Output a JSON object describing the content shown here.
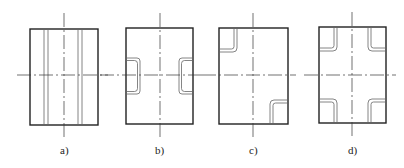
{
  "figures": [
    {
      "id": "a",
      "label": "a)",
      "rect": {
        "x": 30,
        "y": 29,
        "w": 68,
        "h": 96
      },
      "center": {
        "cx": 64,
        "cy": 75,
        "vtop": 13,
        "vbottom": 139,
        "hleft": 17,
        "hright": 108
      },
      "variant": "vertical-grooves",
      "description": "Full-length vertical grooves on both sides of center"
    },
    {
      "id": "b",
      "label": "b)",
      "rect": {
        "x": 126,
        "y": 28,
        "w": 67,
        "h": 96
      },
      "center": {
        "cx": 160,
        "cy": 75,
        "vtop": 13,
        "vbottom": 138,
        "hleft": 100,
        "hright": 203
      },
      "variant": "side-notches",
      "description": "Rounded notches at mid-height on left and right edges"
    },
    {
      "id": "c",
      "label": "c)",
      "rect": {
        "x": 219,
        "y": 28,
        "w": 69,
        "h": 96
      },
      "center": {
        "cx": 253,
        "cy": 75,
        "vtop": 13,
        "vbottom": 138,
        "hleft": 202,
        "hright": 296
      },
      "variant": "diagonal-corners",
      "description": "Rounded corner pockets at top-left and bottom-right"
    },
    {
      "id": "d",
      "label": "d)",
      "rect": {
        "x": 319,
        "y": 27,
        "w": 67,
        "h": 96
      },
      "center": {
        "cx": 352,
        "cy": 75,
        "vtop": 12,
        "vbottom": 138,
        "hleft": 304,
        "hright": 396
      },
      "variant": "four-corners",
      "description": "Rounded corner pockets at all four corners"
    }
  ],
  "colors": {
    "line": "#222222",
    "background": "#ffffff"
  }
}
